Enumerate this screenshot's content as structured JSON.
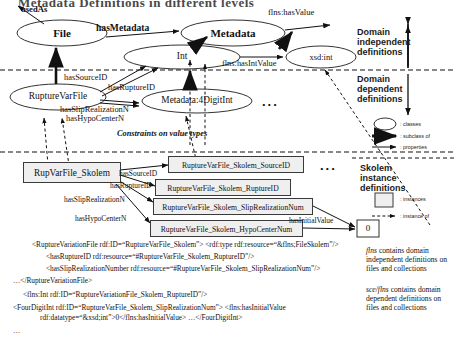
{
  "title": "Metadata Definitions in different levels",
  "diagram": {
    "classes": [
      {
        "id": "file",
        "label": "File"
      },
      {
        "id": "metadata",
        "label": "Metadata"
      },
      {
        "id": "int",
        "label": "Int"
      },
      {
        "id": "xsdint",
        "label": "xsd:int"
      },
      {
        "id": "rupturevarfile",
        "label": "RuptureVarFile"
      },
      {
        "id": "metadata4digitint",
        "label": "Metadata:4DigitInt"
      }
    ],
    "edge_labels": [
      {
        "id": "usedas",
        "label": "usedAs"
      },
      {
        "id": "hasmetadata",
        "label": "hasMetadata"
      },
      {
        "id": "flnshasvalue",
        "label": "flns:hasValue"
      },
      {
        "id": "flnshasintvalue",
        "label": "flns:hasIntValue"
      },
      {
        "id": "hassourceid",
        "label": "hasSourceID"
      },
      {
        "id": "hasruptureid",
        "label": "hasRuptureID"
      },
      {
        "id": "hassliprealizationn",
        "label": "hasSlipRealizationN"
      },
      {
        "id": "hashypocentern",
        "label": "hasHypoCenterN"
      }
    ],
    "constraints_note": "Constraints on value types",
    "ellipsis_upper": "...",
    "ellipsis_lower": "..."
  },
  "skolem": {
    "subject": "RupVarFile_Skolem",
    "instances": [
      {
        "id": "sourceid",
        "label": "RuptureVarFile_Skolem_SourceID"
      },
      {
        "id": "ruptureid",
        "label": "RuptureVarFile_Skolem_RuptureID"
      },
      {
        "id": "sliprealization",
        "label": "RuptureVarFile_Skolem_SlipRealizationNum"
      },
      {
        "id": "hypocenter",
        "label": "RuptureVarFile_Skolem_HypoCenterNum"
      }
    ],
    "edge_labels": [
      {
        "id": "hassourceid",
        "label": "hasSourceID"
      },
      {
        "id": "hasruptureid",
        "label": "hasRuptureID"
      },
      {
        "id": "hassliprealizationn",
        "label": "hasSlipRealizationN"
      },
      {
        "id": "hashypocentern",
        "label": "hasHypoCenterN"
      },
      {
        "id": "hasinitialvalue",
        "label": "hasInitialValue"
      }
    ],
    "value_node": "0",
    "ellipsis": "..."
  },
  "legend": {
    "domain_independent": "Domain\nindependent\ndefinitions",
    "domain_independent_lines": [
      "Domain",
      "independent",
      "definitions"
    ],
    "domain_dependent_lines": [
      "Domain",
      "dependent",
      "definitions"
    ],
    "skolem_lines": [
      "Skolem",
      "instance",
      "definitions"
    ],
    "items": [
      {
        "id": "classes",
        "label": ": classes"
      },
      {
        "id": "subclassof",
        "label": ": subclass of"
      },
      {
        "id": "properties",
        "label": ": properties"
      },
      {
        "id": "instances",
        "label": ": instances"
      },
      {
        "id": "instanceof",
        "label": ": instance of"
      }
    ]
  },
  "code_lines": [
    "<RuptureVariationFile rdf:ID=“RuptureVarFile_Skolem”> <rdf:type rdf:resource=“&flns;FileSkolem”/>",
    "<hasRuptureID rdf:resource=“#RuptureVarFile_Skolem_RuptureID”/>",
    "<hasSlipRealizationNumber rdf:resource=“#RuptureVarFile_Skolem_SlipRealizationNum”/>",
    "…</RuptureVariationFile>",
    "<flns:Int rdf:ID=“RuptureVariationFile_Skolem_RuptureID”/>",
    "<FourDigitInt rdf:ID=“RuptureVarFile_Skolem_SlipRealizationNum”> <flns:hasInitialValue",
    "rdf:datatype=“&xsd;int”>0</flns:hasInitialValue> …</FourDigitInt>",
    "…"
  ],
  "notes": {
    "flns_prefix": "flns",
    "flns_text": " contains domain independent definitions on files and collections",
    "sceflns_prefix": "sce/flns",
    "sceflns_text": " contains domain dependent definitions on files and collections"
  }
}
